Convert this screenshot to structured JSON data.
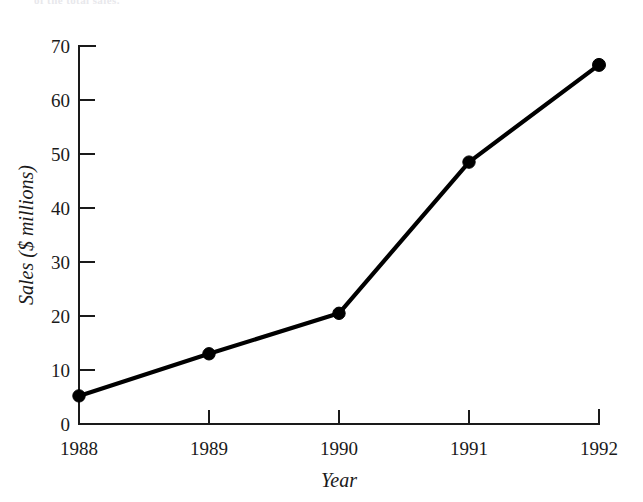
{
  "figure": {
    "caption_remnant": "of the total sales.",
    "background_color": "#ffffff",
    "ink_color": "#1a1a1a"
  },
  "chart_data": {
    "type": "line",
    "title": "",
    "subtitle": "",
    "xlabel": "Year",
    "ylabel": "Sales ($ millions)",
    "categories": [
      "1988",
      "1989",
      "1990",
      "1991",
      "1992"
    ],
    "x": [
      1988,
      1989,
      1990,
      1991,
      1992
    ],
    "values": [
      5.2,
      13.0,
      20.5,
      48.5,
      66.5
    ],
    "series": [
      {
        "name": "Sales",
        "values": [
          5.2,
          13.0,
          20.5,
          48.5,
          66.5
        ],
        "color": "#000000",
        "marker": "filled-circle",
        "line_width": 4.2
      }
    ],
    "xlim": [
      1988,
      1992
    ],
    "ylim": [
      0,
      70
    ],
    "ytick_labels": [
      "0",
      "10",
      "20",
      "30",
      "40",
      "50",
      "60",
      "70"
    ],
    "ytick_values": [
      0,
      10,
      20,
      30,
      40,
      50,
      60,
      70
    ],
    "xtick_labels": [
      "1988",
      "1989",
      "1990",
      "1991",
      "1992"
    ],
    "grid": false,
    "legend": false,
    "legend_position": "none",
    "annotations": []
  },
  "axes": {
    "y_axis_name": "y-axis",
    "x_axis_name": "x-axis",
    "tick_direction": "outward"
  }
}
